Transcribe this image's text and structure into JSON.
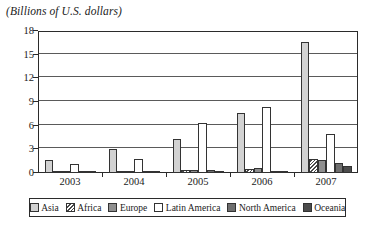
{
  "chart_data": {
    "type": "bar",
    "title": "(Billions of U.S. dollars)",
    "xlabel": "",
    "ylabel": "",
    "ylim": [
      0,
      18
    ],
    "yticks": [
      0,
      3,
      6,
      9,
      12,
      15,
      18
    ],
    "ytick_labels": [
      "0",
      "3",
      "6",
      "9",
      "12",
      "15",
      "18"
    ],
    "grid": true,
    "legend_position": "bottom",
    "categories": [
      "2003",
      "2004",
      "2005",
      "2006",
      "2007"
    ],
    "series": [
      {
        "name": "Asia",
        "values": [
          1.6,
          3.0,
          4.3,
          7.6,
          16.6
        ]
      },
      {
        "name": "Africa",
        "values": [
          0.05,
          0.1,
          0.4,
          0.5,
          1.8
        ]
      },
      {
        "name": "Europe",
        "values": [
          0.25,
          0.25,
          0.4,
          0.65,
          1.6
        ]
      },
      {
        "name": "Latin America",
        "values": [
          1.1,
          1.8,
          6.4,
          8.4,
          4.9
        ]
      },
      {
        "name": "North America",
        "values": [
          0.15,
          0.2,
          0.35,
          0.3,
          1.3
        ]
      },
      {
        "name": "Oceania",
        "values": [
          0.02,
          0.05,
          0.2,
          0.15,
          0.9
        ]
      }
    ]
  },
  "legend": {
    "items": [
      {
        "label": "Asia",
        "swatch": "light-gray-swatch"
      },
      {
        "label": "Africa",
        "swatch": "hatched-swatch"
      },
      {
        "label": "Europe",
        "swatch": "medium-gray-swatch"
      },
      {
        "label": "Latin America",
        "swatch": "white-swatch"
      },
      {
        "label": "North America",
        "swatch": "dark-gray-swatch"
      },
      {
        "label": "Oceania",
        "swatch": "darkest-gray-swatch"
      }
    ]
  },
  "colors": {
    "asia": "#d2d2d2",
    "africa": "#4a4a4a",
    "europe": "#8f8f8f",
    "latin_america": "#ffffff",
    "north_america": "#6e6e6e",
    "oceania": "#4c4c4c",
    "axis": "#2b2b2b",
    "grid": "#5a5a5a",
    "background": "#ffffff"
  }
}
